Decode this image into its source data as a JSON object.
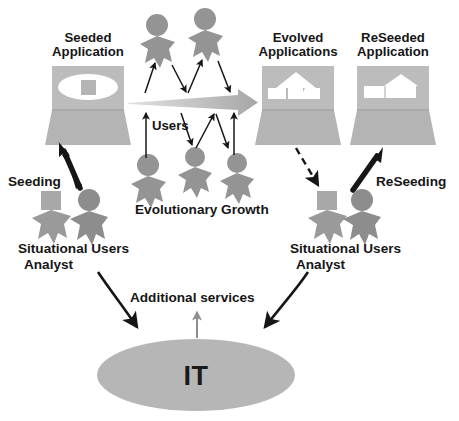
{
  "diagram": {
    "width": 459,
    "height": 421,
    "background": "#ffffff",
    "colors": {
      "app_body": "#bcbcbc",
      "app_body_dark": "#b0b0b0",
      "figure_gray": "#949494",
      "figure_gray_dark": "#8a8a8a",
      "it_ellipse": "#b6b6b6",
      "arrow_black": "#161616",
      "arrow_gray": "#a9a9a9",
      "screen_white": "#ffffff",
      "text": "#161616"
    },
    "labels": {
      "seeded_application": "Seeded\nApplication",
      "seeded_application_line1": "Seeded",
      "seeded_application_line2": "Application",
      "evolved_applications_line1": "Evolved",
      "evolved_applications_line2": "Applications",
      "reseeded_application_line1": "ReSeeded",
      "reseeded_application_line2": "Application",
      "seeding": "Seeding",
      "reseeding": "ReSeeding",
      "users": "Users",
      "evolutionary_growth": "Evolutionary Growth",
      "situational_analyst_left_line1": "Situational Users",
      "situational_analyst_left_line2": "Analyst",
      "situational_analyst_right_line1": "Situational Users",
      "situational_analyst_right_line2": "Analyst",
      "additional_services": "Additional services",
      "it": "IT"
    },
    "nodes": [
      {
        "id": "seeded-application",
        "type": "laptop",
        "label": "Seeded Application",
        "screen_content": "ellipse-with-square"
      },
      {
        "id": "evolved-applications",
        "type": "laptop",
        "label": "Evolved Applications",
        "screen_content": "house-shapes"
      },
      {
        "id": "reseeded-application",
        "type": "laptop",
        "label": "ReSeeded Application",
        "screen_content": "house-shapes-refined"
      },
      {
        "id": "it-platform",
        "type": "ellipse",
        "label": "IT"
      }
    ],
    "actors": [
      {
        "id": "top-user-1",
        "head": "round",
        "role": "user"
      },
      {
        "id": "top-user-2",
        "head": "round",
        "role": "user"
      },
      {
        "id": "bottom-user-1",
        "head": "round",
        "role": "user"
      },
      {
        "id": "bottom-user-2",
        "head": "round",
        "role": "user"
      },
      {
        "id": "bottom-user-3",
        "head": "round",
        "role": "user"
      },
      {
        "id": "left-analyst",
        "head": "square",
        "role": "analyst"
      },
      {
        "id": "left-user",
        "head": "round",
        "role": "user"
      },
      {
        "id": "right-analyst",
        "head": "square",
        "role": "analyst"
      },
      {
        "id": "right-user",
        "head": "round",
        "role": "user"
      }
    ],
    "flows": [
      {
        "id": "seeding-arrow",
        "label": "Seeding",
        "style": "solid-thick-black",
        "from": "left-analyst",
        "to": "seeded-application"
      },
      {
        "id": "growth-arrow",
        "label": "Evolutionary Growth",
        "style": "gradient-gray-wide",
        "from": "seeded-application",
        "to": "evolved-applications"
      },
      {
        "id": "evolved-to-analyst-arrow",
        "label": "",
        "style": "dashed-black",
        "from": "evolved-applications",
        "to": "right-analyst"
      },
      {
        "id": "reseeding-arrow",
        "label": "ReSeeding",
        "style": "solid-thick-black",
        "from": "right-analyst",
        "to": "reseeded-application"
      },
      {
        "id": "left-services-arrow",
        "label": "Additional services",
        "style": "curved-black",
        "from": "left-analyst",
        "to": "it-platform"
      },
      {
        "id": "right-services-arrow",
        "label": "Additional services",
        "style": "curved-black",
        "from": "right-analyst",
        "to": "it-platform"
      },
      {
        "id": "it-up-arrow",
        "label": "Additional services",
        "style": "thin-gray",
        "from": "it-platform",
        "to": "additional-services-label"
      }
    ]
  }
}
